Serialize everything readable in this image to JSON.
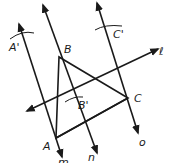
{
  "diagram": {
    "type": "geometric-construction",
    "points": {
      "A": {
        "label": "A",
        "x": 56,
        "y": 138
      },
      "B": {
        "label": "B",
        "x": 59,
        "y": 57
      },
      "C": {
        "label": "C",
        "x": 128,
        "y": 98
      }
    },
    "image_points": {
      "A_prime": {
        "label": "A'"
      },
      "B_prime": {
        "label": "B'"
      },
      "C_prime": {
        "label": "C'"
      }
    },
    "lines": {
      "l": {
        "label": "ℓ"
      },
      "m": {
        "label": "m"
      },
      "n": {
        "label": "n"
      },
      "o": {
        "label": "o"
      }
    },
    "colors": {
      "stroke": "#1a1a1a",
      "background": "#ffffff"
    }
  }
}
